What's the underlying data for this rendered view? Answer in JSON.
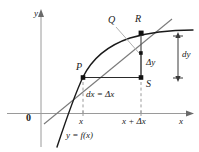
{
  "figure": {
    "kind": "calculus-differentials-diagram",
    "axis": {
      "x_axis_label": "x",
      "y_axis_label": "y",
      "origin_label": "0"
    },
    "tick_labels": {
      "left": "x",
      "right": "x + Δx"
    },
    "points": [
      {
        "name": "P",
        "label": "P"
      },
      {
        "name": "Q",
        "label": "Q"
      },
      {
        "name": "R",
        "label": "R"
      },
      {
        "name": "S",
        "label": "S"
      }
    ],
    "annotations": {
      "delta_y": "Δy",
      "dy": "dy",
      "dx_equals_delta_x": "dx = Δx",
      "curve_equation": "y = f(x)"
    },
    "colors": {
      "curve": "#1a1a1a",
      "tangent": "#6f6f6f",
      "axis": "#9a9a9a",
      "dashed": "#9a9a9a",
      "leader": "#a8a8a8",
      "text": "#1a1a1a"
    }
  }
}
